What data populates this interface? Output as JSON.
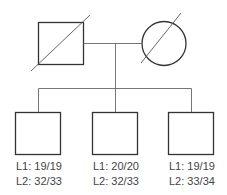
{
  "pedigree": {
    "parents": [
      {
        "sex": "male",
        "status": "deceased",
        "shape": "square"
      },
      {
        "sex": "female",
        "status": "deceased",
        "shape": "circle"
      }
    ],
    "children": [
      {
        "sex": "male",
        "shape": "square",
        "l1": "L1: 19/19",
        "l2": "L2: 32/33"
      },
      {
        "sex": "male",
        "shape": "square",
        "l1": "L1: 20/20",
        "l2": "L2: 32/33"
      },
      {
        "sex": "male",
        "shape": "square",
        "l1": "L1: 19/19",
        "l2": "L2: 33/34"
      }
    ],
    "colors": {
      "stroke": "#333333",
      "line": "#666666",
      "text": "#444444"
    }
  }
}
